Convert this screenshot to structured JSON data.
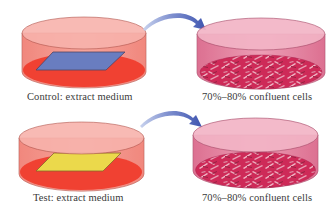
{
  "diagram": {
    "rows": [
      {
        "name": "control",
        "left_dish": {
          "label": "Control: extract medium",
          "sample_shape": "parallelogram",
          "sample_color": "#4a74c9",
          "medium_color": "#ee2b1c"
        },
        "right_dish": {
          "label": "70%–80% confluent cells",
          "cell_color": "#c81547"
        },
        "arrow": "arrow-right-curved"
      },
      {
        "name": "test",
        "left_dish": {
          "label": "Test: extract medium",
          "sample_shape": "parallelogram",
          "sample_color": "#e8e43a",
          "medium_color": "#ee2b1c"
        },
        "right_dish": {
          "label": "70%–80% confluent cells",
          "cell_color": "#c81547"
        },
        "arrow": "arrow-right-curved"
      }
    ],
    "colors": {
      "dish_wall_left": "#f28a80",
      "dish_top_left": "#f7b3ac",
      "dish_wall_right": "#e07893",
      "dish_top_right": "#f2b4c6",
      "arrow": "#4b5fb5"
    }
  }
}
